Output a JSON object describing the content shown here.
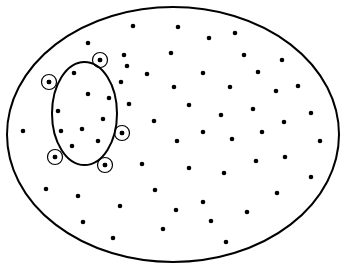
{
  "diagram": {
    "width": 345,
    "height": 268,
    "background": "#ffffff",
    "stroke_color": "#000000",
    "dot_color": "#000000",
    "dot_radius": 2.3,
    "outer_ellipse": {
      "cx": 173,
      "cy": 134.5,
      "rx": 166,
      "ry": 127.5,
      "stroke_width": 2
    },
    "inner_ellipse": {
      "cx": 84.5,
      "cy": 113.5,
      "rx": 32.5,
      "ry": 51.5,
      "stroke_width": 2
    },
    "circled_radius": 7.5,
    "circled_dots": [
      {
        "x": 100,
        "y": 60
      },
      {
        "x": 49,
        "y": 82
      },
      {
        "x": 122,
        "y": 133
      },
      {
        "x": 55,
        "y": 157
      },
      {
        "x": 105,
        "y": 165
      }
    ],
    "inner_dots": [
      {
        "x": 74,
        "y": 73
      },
      {
        "x": 88,
        "y": 94
      },
      {
        "x": 109,
        "y": 98
      },
      {
        "x": 58,
        "y": 111
      },
      {
        "x": 103,
        "y": 119
      },
      {
        "x": 61,
        "y": 131
      },
      {
        "x": 82,
        "y": 129
      },
      {
        "x": 98,
        "y": 141
      },
      {
        "x": 72,
        "y": 146
      }
    ],
    "outer_dots": [
      {
        "x": 133,
        "y": 26
      },
      {
        "x": 178,
        "y": 27
      },
      {
        "x": 235,
        "y": 33
      },
      {
        "x": 209,
        "y": 38
      },
      {
        "x": 88,
        "y": 43
      },
      {
        "x": 171,
        "y": 53
      },
      {
        "x": 124,
        "y": 55
      },
      {
        "x": 244,
        "y": 55
      },
      {
        "x": 282,
        "y": 60
      },
      {
        "x": 127,
        "y": 66
      },
      {
        "x": 258,
        "y": 72
      },
      {
        "x": 203,
        "y": 73
      },
      {
        "x": 147,
        "y": 74
      },
      {
        "x": 121,
        "y": 82
      },
      {
        "x": 298,
        "y": 86
      },
      {
        "x": 174,
        "y": 87
      },
      {
        "x": 230,
        "y": 87
      },
      {
        "x": 276,
        "y": 91
      },
      {
        "x": 129,
        "y": 104
      },
      {
        "x": 189,
        "y": 105
      },
      {
        "x": 253,
        "y": 109
      },
      {
        "x": 311,
        "y": 113
      },
      {
        "x": 221,
        "y": 115
      },
      {
        "x": 154,
        "y": 121
      },
      {
        "x": 284,
        "y": 122
      },
      {
        "x": 23,
        "y": 131
      },
      {
        "x": 203,
        "y": 132
      },
      {
        "x": 262,
        "y": 132
      },
      {
        "x": 232,
        "y": 139
      },
      {
        "x": 177,
        "y": 141
      },
      {
        "x": 320,
        "y": 141
      },
      {
        "x": 285,
        "y": 157
      },
      {
        "x": 256,
        "y": 161
      },
      {
        "x": 142,
        "y": 164
      },
      {
        "x": 189,
        "y": 168
      },
      {
        "x": 224,
        "y": 173
      },
      {
        "x": 311,
        "y": 177
      },
      {
        "x": 46,
        "y": 189
      },
      {
        "x": 155,
        "y": 190
      },
      {
        "x": 277,
        "y": 193
      },
      {
        "x": 78,
        "y": 196
      },
      {
        "x": 203,
        "y": 202
      },
      {
        "x": 120,
        "y": 206
      },
      {
        "x": 176,
        "y": 210
      },
      {
        "x": 247,
        "y": 212
      },
      {
        "x": 211,
        "y": 221
      },
      {
        "x": 83,
        "y": 222
      },
      {
        "x": 163,
        "y": 229
      },
      {
        "x": 113,
        "y": 238
      },
      {
        "x": 226,
        "y": 242
      }
    ]
  }
}
